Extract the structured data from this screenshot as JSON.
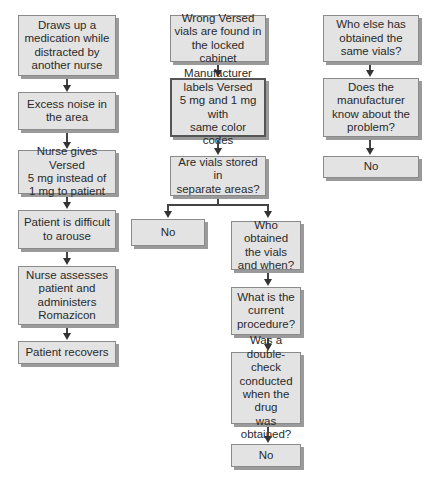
{
  "flowchart": {
    "column1": {
      "nodes": [
        {
          "text": "Draws up a\nmedication while\ndistracted by\nanother nurse"
        },
        {
          "text": "Excess noise in\nthe area"
        },
        {
          "text": "Nurse gives Versed\n5 mg instead of\n1 mg to patient"
        },
        {
          "text": "Patient is difficult\nto arouse"
        },
        {
          "text": "Nurse assesses\npatient and\nadministers\nRomazicon"
        },
        {
          "text": "Patient recovers"
        }
      ]
    },
    "column2": {
      "nodes": [
        {
          "text": "Wrong Versed\nvials are found in\nthe locked cabinet"
        },
        {
          "text": "Manufacturer\nlabels Versed\n5 mg and 1 mg with\nsame color codes"
        },
        {
          "text": "Are vials stored in\nseparate areas?"
        }
      ],
      "branch_left": {
        "text": "No"
      },
      "branch_right": [
        {
          "text": "Who obtained\nthe vials\nand when?"
        },
        {
          "text": "What is the\ncurrent\nprocedure?"
        },
        {
          "text": "Was a\ndouble-check\nconducted\nwhen the drug\nwas obtained?"
        },
        {
          "text": "No"
        }
      ]
    },
    "column3": {
      "nodes": [
        {
          "text": "Who else has\nobtained the\nsame vials?"
        },
        {
          "text": "Does the\nmanufacturer\nknow about the\nproblem?"
        },
        {
          "text": "No"
        }
      ]
    }
  },
  "colors": {
    "box_fill": "#e3e3e3",
    "box_border": "#8a8a8a",
    "shadow": "#9a9a9a",
    "arrow": "#333333"
  }
}
